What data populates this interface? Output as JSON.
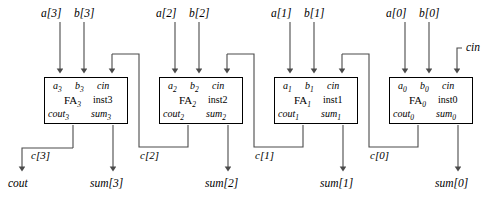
{
  "diagram": {
    "stroke_color": "#4a4a4a",
    "text_color": "#000000",
    "background": "#ffffff",
    "external_cin_label": "cin",
    "external_cout_label": "cout",
    "stages": [
      {
        "index": 3,
        "input_a_label": "a[3]",
        "input_b_label": "b[3]",
        "pin_a": "a",
        "pin_a_sub": "3",
        "pin_b": "b",
        "pin_b_sub": "3",
        "pin_cin": "cin",
        "block_name": "FA",
        "block_sub": "3",
        "instance": "inst3",
        "pin_cout": "cout",
        "pin_cout_sub": "3",
        "pin_sum": "sum",
        "pin_sum_sub": "3",
        "carry_label": "c[3]",
        "sum_label": "sum[3]"
      },
      {
        "index": 2,
        "input_a_label": "a[2]",
        "input_b_label": "b[2]",
        "pin_a": "a",
        "pin_a_sub": "2",
        "pin_b": "b",
        "pin_b_sub": "2",
        "pin_cin": "cin",
        "block_name": "FA",
        "block_sub": "2",
        "instance": "inst2",
        "pin_cout": "cout",
        "pin_cout_sub": "2",
        "pin_sum": "sum",
        "pin_sum_sub": "2",
        "carry_label": "c[2]",
        "sum_label": "sum[2]"
      },
      {
        "index": 1,
        "input_a_label": "a[1]",
        "input_b_label": "b[1]",
        "pin_a": "a",
        "pin_a_sub": "1",
        "pin_b": "b",
        "pin_b_sub": "1",
        "pin_cin": "cin",
        "block_name": "FA",
        "block_sub": "1",
        "instance": "inst1",
        "pin_cout": "cout",
        "pin_cout_sub": "1",
        "pin_sum": "sum",
        "pin_sum_sub": "1",
        "carry_label": "c[1]",
        "sum_label": "sum[1]"
      },
      {
        "index": 0,
        "input_a_label": "a[0]",
        "input_b_label": "b[0]",
        "pin_a": "a",
        "pin_a_sub": "0",
        "pin_b": "b",
        "pin_b_sub": "0",
        "pin_cin": "cin",
        "block_name": "FA",
        "block_sub": "0",
        "instance": "inst0",
        "pin_cout": "cout",
        "pin_cout_sub": "0",
        "pin_sum": "sum",
        "pin_sum_sub": "0",
        "carry_label": "c[0]",
        "sum_label": "sum[0]"
      }
    ]
  }
}
